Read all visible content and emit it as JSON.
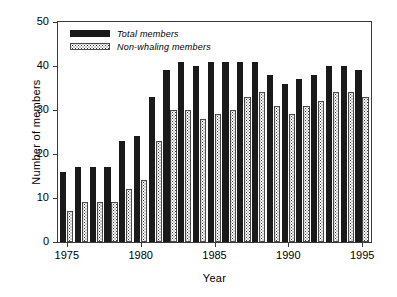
{
  "chart_data": {
    "type": "bar",
    "title": "",
    "xlabel": "Year",
    "ylabel": "Number of  members",
    "ylim": [
      0,
      50
    ],
    "yticks": [
      0,
      10,
      20,
      30,
      40,
      50
    ],
    "xlim": [
      1974.4,
      1995.6
    ],
    "xticks": [
      1975,
      1980,
      1985,
      1990,
      1995
    ],
    "grid": false,
    "legend_position": "top-left",
    "categories": [
      1975,
      1976,
      1977,
      1978,
      1979,
      1980,
      1981,
      1982,
      1983,
      1984,
      1985,
      1986,
      1987,
      1988,
      1989,
      1990,
      1991,
      1992,
      1993,
      1994,
      1995
    ],
    "series": [
      {
        "name": "Total members",
        "color": "#1a1a1a",
        "pattern": "solid",
        "values": [
          16,
          17,
          17,
          17,
          23,
          24,
          33,
          39,
          41,
          40,
          41,
          41,
          41,
          41,
          38,
          36,
          37,
          38,
          40,
          40,
          39
        ]
      },
      {
        "name": "Non-whaling members",
        "color": "#ffffff",
        "pattern": "dotted",
        "values": [
          7,
          9,
          9,
          9,
          12,
          14,
          23,
          30,
          30,
          28,
          29,
          30,
          33,
          34,
          31,
          29,
          31,
          32,
          34,
          34,
          33
        ]
      }
    ]
  },
  "legend": {
    "items": [
      {
        "label": "Total members"
      },
      {
        "label": "Non-whaling members"
      }
    ]
  },
  "axes": {
    "ylabel": "Number of  members",
    "xlabel": "Year"
  }
}
